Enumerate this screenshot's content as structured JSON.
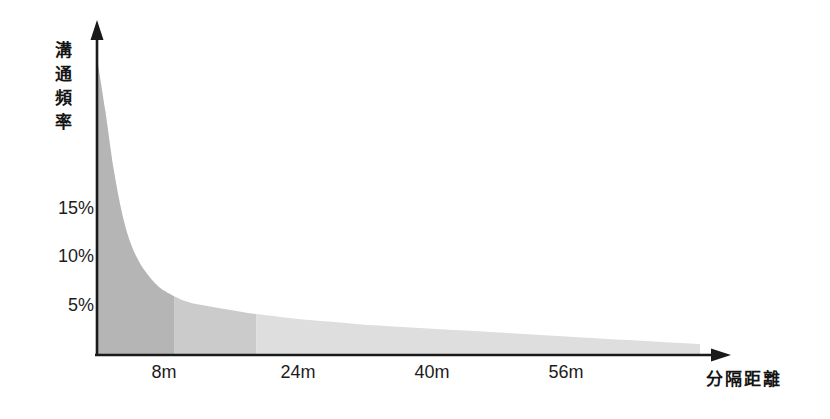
{
  "chart_data": {
    "type": "area",
    "title": "",
    "subtitle": "",
    "xlabel": "分隔距離",
    "ylabel": "溝通頻率",
    "x_unit": "m",
    "grid": false,
    "legend": null,
    "xlim": [
      0,
      72
    ],
    "ylim": [
      0,
      33
    ],
    "x_tick_labels": [
      "8m",
      "24m",
      "40m",
      "56m"
    ],
    "x_tick_values": [
      8,
      24,
      40,
      56
    ],
    "y_tick_labels": [
      "5%",
      "10%",
      "15%"
    ],
    "y_tick_values": [
      5,
      10,
      15
    ],
    "series": [
      {
        "name": "溝通頻率",
        "x": [
          0,
          1,
          2,
          3,
          4,
          5,
          6,
          7,
          8,
          10,
          12,
          14,
          16,
          18,
          20,
          24,
          28,
          32,
          36,
          40,
          44,
          48,
          52,
          56,
          60,
          64,
          68,
          72
        ],
        "values": [
          30.5,
          25.0,
          19.0,
          14.5,
          11.5,
          9.6,
          8.3,
          7.3,
          6.6,
          5.7,
          5.2,
          4.9,
          4.6,
          4.3,
          4.1,
          3.7,
          3.4,
          3.1,
          2.9,
          2.7,
          2.5,
          2.3,
          2.1,
          1.9,
          1.7,
          1.5,
          1.3,
          1.1
        ]
      }
    ],
    "shaded_bands": [
      {
        "name": "near-zone",
        "x_start": 0,
        "x_end": 9.2,
        "color": "#b5b5b5"
      },
      {
        "name": "mid-zone",
        "x_start": 9.2,
        "x_end": 19.0,
        "color": "#cbcbcb"
      },
      {
        "name": "far-zone",
        "x_start": 19.0,
        "x_end": 72,
        "color": "#dedede"
      }
    ],
    "axis_color": "#1a1a1a",
    "annotations": []
  },
  "y_axis_title_chars": [
    "溝",
    "通",
    "頻",
    "率"
  ]
}
